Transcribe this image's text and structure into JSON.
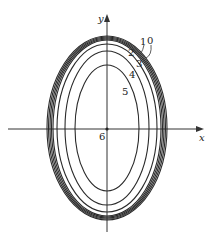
{
  "diagram": {
    "title": "",
    "axes": {
      "x_label": "x",
      "y_label": "y",
      "origin_label": "6"
    },
    "colors": {
      "curve": "#2a2a2a",
      "axis": "#333333",
      "background": "#ffffff"
    },
    "curve_labels": [
      "0",
      "1",
      "2",
      "3",
      "4",
      "5"
    ],
    "curves": [
      {
        "label": "0",
        "rx": 59,
        "ry": 92
      },
      {
        "label": "1",
        "rx": 57,
        "ry": 91
      },
      {
        "label": "2",
        "rx": 55,
        "ry": 90
      },
      {
        "label": "3",
        "rx": 50,
        "ry": 86
      },
      {
        "label": "4",
        "rx": 42,
        "ry": 79
      },
      {
        "label": "5",
        "rx": 31,
        "ry": 64
      }
    ]
  }
}
